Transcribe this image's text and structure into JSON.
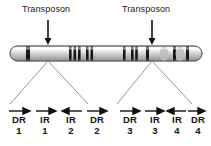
{
  "figure": {
    "background_color": "#ffffff",
    "ink_color": "#1a1a1a"
  },
  "annotations": [
    {
      "id": "transposon-left",
      "label": "Transposon",
      "label_x": 22,
      "label_y": 5,
      "arrow_x": 48,
      "arrow_top": 20,
      "arrow_bottom": 44
    },
    {
      "id": "transposon-right",
      "label": "Transposon",
      "label_x": 122,
      "label_y": 5,
      "arrow_x": 152,
      "arrow_top": 20,
      "arrow_bottom": 44
    }
  ],
  "chromosome": {
    "name": "chromosome-bar",
    "x": 10,
    "y": 46,
    "width": 192,
    "height": 15,
    "body_color": "#cfcfcf",
    "edge_color": "#6e6e6e",
    "band_color": "#2a2a2a",
    "bands": [
      {
        "x": 16,
        "width": 4
      },
      {
        "x": 59,
        "width": 2.5
      },
      {
        "x": 63.5,
        "width": 2.5
      },
      {
        "x": 68,
        "width": 2.5
      },
      {
        "x": 76,
        "width": 2.5
      },
      {
        "x": 80.5,
        "width": 2.5
      },
      {
        "x": 113,
        "width": 2.5
      },
      {
        "x": 121,
        "width": 2.5
      },
      {
        "x": 125,
        "width": 2.5
      },
      {
        "x": 136,
        "width": 3
      },
      {
        "x": 163,
        "width": 3
      },
      {
        "x": 176,
        "width": 3
      }
    ],
    "constriction_x": 168
  },
  "guides": [
    {
      "id": "guide-left",
      "apex_x": 48,
      "apex_y": 61,
      "left_x": 10,
      "right_x": 88,
      "base_y": 104
    },
    {
      "id": "guide-right",
      "apex_x": 152,
      "apex_y": 61,
      "left_x": 117,
      "right_x": 192,
      "base_y": 104
    }
  ],
  "repeats": {
    "arrow_y": 111,
    "code_y": 115,
    "groups": [
      {
        "id": "group-left",
        "elements": [
          {
            "id": "dr-1",
            "code": "DR",
            "number": "1",
            "direction": "right",
            "x": 8
          },
          {
            "id": "ir-1",
            "code": "IR",
            "number": "1",
            "direction": "right",
            "x": 37
          },
          {
            "id": "ir-2",
            "code": "IR",
            "number": "2",
            "direction": "left",
            "x": 63
          },
          {
            "id": "dr-2",
            "code": "DR",
            "number": "2",
            "direction": "right",
            "x": 88
          }
        ]
      },
      {
        "id": "group-right",
        "elements": [
          {
            "id": "dr-3",
            "code": "DR",
            "number": "3",
            "direction": "right",
            "x": 120
          },
          {
            "id": "ir-3",
            "code": "IR",
            "number": "3",
            "direction": "right",
            "x": 146
          },
          {
            "id": "ir-4",
            "code": "IR",
            "number": "4",
            "direction": "left",
            "x": 169
          },
          {
            "id": "dr-4",
            "code": "DR",
            "number": "4",
            "direction": "right",
            "x": 191
          }
        ]
      }
    ]
  }
}
